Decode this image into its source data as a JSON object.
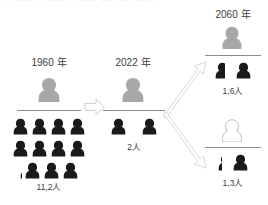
{
  "meta": {
    "top_cut_text": "·· ···· ·· ···· ·· ···· ···· ··· ····",
    "colors": {
      "dark_person": "#1a1a1a",
      "gray_person": "#a8a8a8",
      "outline_person_stroke": "#b0b0b0",
      "outline_person_fill": "#ffffff",
      "divider": "#8c8c8c",
      "arrow_stroke": "#cccccc",
      "text": "#3c3c3c"
    }
  },
  "columns": [
    {
      "id": "col-1960",
      "year_label": "1960 年",
      "top_person_style": "gray",
      "count_label": "11,2人",
      "rows": [
        {
          "full": 4,
          "partial": 0
        },
        {
          "full": 4,
          "partial": 0
        },
        {
          "full": 3,
          "partial": 0.2
        }
      ]
    },
    {
      "id": "col-2022",
      "year_label": "2022 年",
      "top_person_style": "gray",
      "count_label": "2人",
      "rows": [
        {
          "full": 2,
          "partial": 0
        }
      ]
    },
    {
      "id": "col-2060-upper",
      "year_label": "2060 年",
      "top_person_style": "gray",
      "count_label": "1,6人",
      "rows": [
        {
          "full": 1,
          "partial": 0.6
        }
      ]
    },
    {
      "id": "col-2060-lower",
      "year_label": "",
      "top_person_style": "outline",
      "count_label": "1,3人",
      "rows": [
        {
          "full": 1,
          "partial": 0.3
        }
      ]
    }
  ],
  "arrows": [
    {
      "id": "arrow-1960-to-2022",
      "direction": "right"
    },
    {
      "id": "arrow-2022-to-2060-upper",
      "direction": "up-right"
    },
    {
      "id": "arrow-2022-to-2060-lower",
      "direction": "down-right"
    }
  ]
}
